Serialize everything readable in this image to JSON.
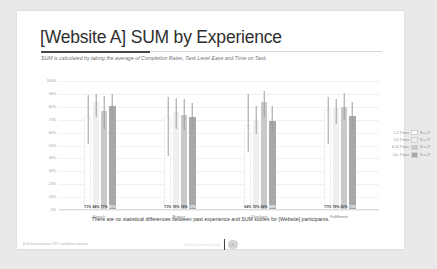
{
  "slide": {
    "title": "[Website A] SUM by Experience",
    "subtitle": "SUM is calculated by taking the average of Completion Rates, Task Level Ease and Time on Task.",
    "caption": "There are no statistical differences between past experience and SUM scores for [Website] participants.",
    "footnote": "Error bars represent 95% confidence intervals.",
    "footer_center_text": "[Website] Usability Study",
    "footer_page": "25"
  },
  "chart_data": {
    "type": "bar",
    "title": "[Website A] SUM by Experience",
    "xlabel": "",
    "ylabel": "",
    "ylim": [
      0,
      100
    ],
    "grid": true,
    "legend_position": "right",
    "categories": [
      "Search",
      "Browse",
      "Checkout",
      "Fulfillment"
    ],
    "ytick_labels": [
      "100%",
      "90%",
      "80%",
      "70%",
      "60%",
      "50%",
      "40%",
      "30%",
      "20%",
      "10%",
      "0%"
    ],
    "ytick_values": [
      100,
      90,
      80,
      70,
      60,
      50,
      40,
      30,
      20,
      10,
      0
    ],
    "series": [
      {
        "name": "1-2 Times",
        "n_label": "N = 27",
        "color": "#ffffff",
        "values": [
          71,
          71,
          64,
          77
        ],
        "value_labels": [
          "71%",
          "71%",
          "64%",
          "77%"
        ],
        "err_low": [
          51,
          42,
          45,
          51
        ],
        "err_high": [
          89,
          88,
          90,
          88
        ]
      },
      {
        "name": "3-5 Times",
        "n_label": "N = 27",
        "color": "#efefef",
        "values": [
          84,
          76,
          70,
          79
        ],
        "value_labels": [
          "84%",
          "76%",
          "70%",
          "79%"
        ],
        "err_low": [
          72,
          63,
          59,
          67
        ],
        "err_high": [
          90,
          87,
          81,
          86
        ]
      },
      {
        "name": "6-10 Times",
        "n_label": "N = 27",
        "color": "#c9c9c9",
        "values": [
          77,
          74,
          84,
          80
        ],
        "value_labels": [
          "77%",
          "74%",
          "84%",
          "80%"
        ],
        "err_low": [
          63,
          62,
          72,
          70
        ],
        "err_high": [
          88,
          86,
          92,
          91
        ]
      },
      {
        "name": "10+ Times",
        "n_label": "N = 27",
        "color": "#a8a8a8",
        "values": [
          81,
          72,
          69,
          73
        ],
        "value_labels": [
          "81%",
          "72%",
          "69%",
          "73%"
        ],
        "err_low": [
          70,
          62,
          60,
          63
        ],
        "err_high": [
          90,
          83,
          81,
          84
        ]
      }
    ]
  }
}
